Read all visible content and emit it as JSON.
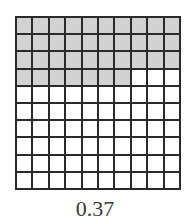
{
  "figure": {
    "rows": 10,
    "cols": 10,
    "shaded_count": 37,
    "shade_color": "#d2d2d2",
    "line_color": "#2a2a2a",
    "label": "0.37"
  }
}
